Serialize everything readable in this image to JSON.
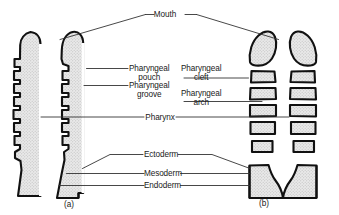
{
  "figure": {
    "title_label": "Mouth",
    "panels": [
      {
        "id": "a",
        "caption": "(a)",
        "description": "continuous pharyngeal wall with pouches and grooves"
      },
      {
        "id": "b",
        "caption": "(b)",
        "description": "separated pharyngeal arches with clefts"
      }
    ],
    "labels": {
      "mouth": "Mouth",
      "pharyngeal_pouch_line1": "Pharyngeal",
      "pharyngeal_pouch_line2": "pouch",
      "pharyngeal_groove_line1": "Pharyngeal",
      "pharyngeal_groove_line2": "groove",
      "pharyngeal_cleft_line1": "Pharyngeal",
      "pharyngeal_cleft_line2": "cleft",
      "pharyngeal_arch_line1": "Pharyngeal",
      "pharyngeal_arch_line2": "arch",
      "pharynx": "Pharynx",
      "ectoderm": "Ectoderm",
      "mesoderm": "Mesoderm",
      "endoderm": "Endoderm"
    },
    "colors": {
      "outline": "#111111",
      "fill_stipple_light": "#d9d9d9",
      "fill_base": "#e6e6e6",
      "leader_line": "#333333",
      "background": "#ffffff",
      "text": "#1a1a1a"
    },
    "panel_a": {
      "pouch_count": 5,
      "groove_count": 5,
      "shape": "half-profile with undulating medial border"
    },
    "panel_b": {
      "arch_block_count": 5,
      "top_cap": "rounded maxillary process",
      "bottom_mass": "cardiac/thoracic mass"
    }
  }
}
